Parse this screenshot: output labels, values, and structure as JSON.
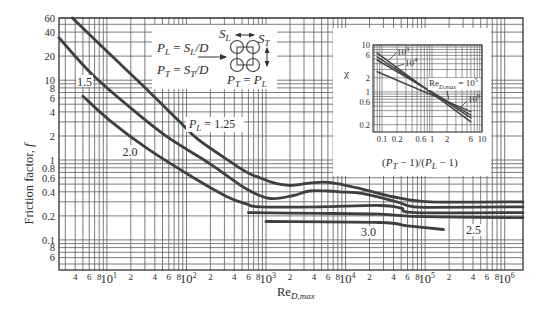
{
  "colors": {
    "curve": "#3f3f3f",
    "grid": "#646464",
    "text": "#2b2b2b",
    "background": "#ffffff"
  },
  "chart_data": [
    {
      "id": "main",
      "type": "line",
      "title": "",
      "xlabel": {
        "base": "Re",
        "sub": "D,max"
      },
      "ylabel": {
        "text": "Friction factor, ",
        "symbol": "f"
      },
      "xscale": "log",
      "yscale": "log",
      "xlim": [
        2.5,
        1700000
      ],
      "ylim": [
        0.042,
        60
      ],
      "grid": true,
      "legend": "none (curves labeled directly)",
      "x_ticks": [
        {
          "value": 4,
          "label": "4"
        },
        {
          "value": 6,
          "label": "6"
        },
        {
          "value": 8,
          "label": "8"
        },
        {
          "value": 10,
          "label": "10",
          "sup": "1"
        },
        {
          "value": 20,
          "label": "2"
        },
        {
          "value": 40,
          "label": "4"
        },
        {
          "value": 60,
          "label": "6"
        },
        {
          "value": 80,
          "label": "8"
        },
        {
          "value": 100,
          "label": "10",
          "sup": "2"
        },
        {
          "value": 200,
          "label": "2"
        },
        {
          "value": 400,
          "label": "4"
        },
        {
          "value": 600,
          "label": "6"
        },
        {
          "value": 800,
          "label": "8"
        },
        {
          "value": 1000,
          "label": "10",
          "sup": "3"
        },
        {
          "value": 2000,
          "label": "2"
        },
        {
          "value": 4000,
          "label": "4"
        },
        {
          "value": 6000,
          "label": "6"
        },
        {
          "value": 8000,
          "label": "8"
        },
        {
          "value": 10000,
          "label": "10",
          "sup": "4"
        },
        {
          "value": 20000,
          "label": "2"
        },
        {
          "value": 40000,
          "label": "4"
        },
        {
          "value": 60000,
          "label": "6"
        },
        {
          "value": 80000,
          "label": "8"
        },
        {
          "value": 100000,
          "label": "10",
          "sup": "5"
        },
        {
          "value": 200000,
          "label": "2"
        },
        {
          "value": 400000,
          "label": "4"
        },
        {
          "value": 600000,
          "label": "6"
        },
        {
          "value": 800000,
          "label": "8"
        },
        {
          "value": 1000000,
          "label": "10",
          "sup": "6"
        }
      ],
      "y_ticks": [
        {
          "value": 60,
          "label": "60"
        },
        {
          "value": 40,
          "label": "40"
        },
        {
          "value": 20,
          "label": "20"
        },
        {
          "value": 10,
          "label": "10"
        },
        {
          "value": 8,
          "label": "8"
        },
        {
          "value": 6,
          "label": "6"
        },
        {
          "value": 4,
          "label": "4"
        },
        {
          "value": 2,
          "label": "2"
        },
        {
          "value": 1,
          "label": "1"
        },
        {
          "value": 0.8,
          "label": "0.8"
        },
        {
          "value": 0.6,
          "label": "0.6"
        },
        {
          "value": 0.4,
          "label": "0.4"
        },
        {
          "value": 0.2,
          "label": "0.2"
        },
        {
          "value": 0.1,
          "label": "0.1"
        },
        {
          "value": 0.08,
          "label": "8"
        },
        {
          "value": 0.06,
          "label": "6"
        }
      ],
      "series_label_prefix": {
        "symbol": "P",
        "sub": "L",
        "eq": " = "
      },
      "series": [
        {
          "name": "P_L = 1.25",
          "label": "1.25",
          "points": [
            [
              3.7,
              60
            ],
            [
              10,
              23
            ],
            [
              30,
              8.1
            ],
            [
              80,
              3.1
            ],
            [
              136,
              1.85
            ],
            [
              280,
              1.12
            ],
            [
              577,
              0.7
            ],
            [
              840,
              0.6
            ],
            [
              1220,
              0.52
            ],
            [
              2000,
              0.48
            ],
            [
              3300,
              0.51
            ],
            [
              5500,
              0.53
            ],
            [
              9300,
              0.49
            ],
            [
              16600,
              0.43
            ],
            [
              44000,
              0.34
            ],
            [
              115000,
              0.3
            ],
            [
              1700000,
              0.3
            ]
          ]
        },
        {
          "name": "P_L = 1.5",
          "label": "1.5",
          "points": [
            [
              2.5,
              34
            ],
            [
              6.7,
              11.5
            ],
            [
              26,
              3.6
            ],
            [
              62,
              1.85
            ],
            [
              200,
              0.89
            ],
            [
              577,
              0.43
            ],
            [
              1120,
              0.33
            ],
            [
              2200,
              0.36
            ],
            [
              3500,
              0.41
            ],
            [
              6000,
              0.41
            ],
            [
              8500,
              0.4
            ],
            [
              16600,
              0.38
            ],
            [
              44000,
              0.3
            ],
            [
              64000,
              0.265
            ],
            [
              115000,
              0.255
            ],
            [
              1700000,
              0.26
            ]
          ]
        },
        {
          "name": "P_L = 2.0",
          "label": "2.0",
          "points": [
            [
              5,
              6.3
            ],
            [
              11,
              3.1
            ],
            [
              32,
              1.4
            ],
            [
              120,
              0.61
            ],
            [
              320,
              0.35
            ],
            [
              577,
              0.28
            ],
            [
              840,
              0.26
            ],
            [
              4800,
              0.26
            ],
            [
              27000,
              0.27
            ],
            [
              50000,
              0.25
            ],
            [
              75000,
              0.22
            ],
            [
              1700000,
              0.22
            ]
          ]
        },
        {
          "name": "P_L = 2.5",
          "label": "2.5",
          "points": [
            [
              600,
              0.22
            ],
            [
              5000,
              0.215
            ],
            [
              27000,
              0.21
            ],
            [
              100000,
              0.195
            ],
            [
              1700000,
              0.19
            ]
          ]
        },
        {
          "name": "P_L = 3.0",
          "label": "3.0",
          "points": [
            [
              1000,
              0.17
            ],
            [
              27000,
              0.165
            ],
            [
              60000,
              0.15
            ],
            [
              170000,
              0.135
            ]
          ]
        }
      ]
    },
    {
      "id": "inset",
      "type": "line",
      "title": "",
      "xlabel": {
        "open": "(",
        "p1": "P",
        "p1_sub": "T",
        "mid": " − 1)/(",
        "p2": "P",
        "p2_sub": "L",
        "close": " − 1)"
      },
      "ylabel": "χ",
      "xscale": "log",
      "yscale": "log",
      "xlim": [
        0.066,
        10
      ],
      "ylim": [
        0.14,
        10
      ],
      "grid": true,
      "x_ticks": [
        {
          "value": 0.1,
          "label": "0.1"
        },
        {
          "value": 0.2,
          "label": "0.2"
        },
        {
          "value": 0.6,
          "label": "0.6"
        },
        {
          "value": 1,
          "label": "1"
        },
        {
          "value": 2,
          "label": "2"
        },
        {
          "value": 6,
          "label": "6"
        },
        {
          "value": 10,
          "label": "10"
        }
      ],
      "y_ticks": [
        {
          "value": 10,
          "label": "10"
        },
        {
          "value": 6,
          "label": "6"
        },
        {
          "value": 2,
          "label": "2"
        },
        {
          "value": 1,
          "label": "1"
        },
        {
          "value": 0.6,
          "label": "0.6"
        },
        {
          "value": 0.2,
          "label": "0.2"
        }
      ],
      "series": [
        {
          "name": "Re_D,max = 10^3",
          "label": {
            "base": "10",
            "sup": "3"
          },
          "points": [
            [
              0.08,
              6.7
            ],
            [
              6,
              0.23
            ]
          ]
        },
        {
          "name": "Re_D,max = 10^4",
          "label": {
            "base": "10",
            "sup": "4"
          },
          "points": [
            [
              0.08,
              5.6
            ],
            [
              6,
              0.28
            ]
          ]
        },
        {
          "name": "Re_D,max = 10^5",
          "label": {
            "pre": "Re",
            "pre_sub": "D,max",
            "eq": " = ",
            "base": "10",
            "sup": "5"
          },
          "points": [
            [
              0.08,
              4.8
            ],
            [
              6,
              0.32
            ]
          ]
        },
        {
          "name": "Re_D,max = 10^6",
          "label": {
            "base": "10",
            "sup": "6"
          },
          "points": [
            [
              0.08,
              2.7
            ],
            [
              6,
              0.38
            ]
          ]
        }
      ]
    }
  ],
  "diagram": {
    "eq_pl": {
      "lhs": "P",
      "lhs_sub": "L",
      "eq": " = ",
      "rhs": "S",
      "rhs_sub": "L",
      "tail": "/D"
    },
    "eq_pt": {
      "lhs": "P",
      "lhs_sub": "T",
      "eq": " = ",
      "rhs": "S",
      "rhs_sub": "T",
      "tail": "/D"
    },
    "sl_label": {
      "sym": "S",
      "sub": "L"
    },
    "st_label": {
      "sym": "S",
      "sub": "T"
    },
    "eq_ptpl": {
      "lhs": "P",
      "lhs_sub": "T",
      "eq": " = ",
      "rhs": "P",
      "rhs_sub": "L"
    }
  }
}
